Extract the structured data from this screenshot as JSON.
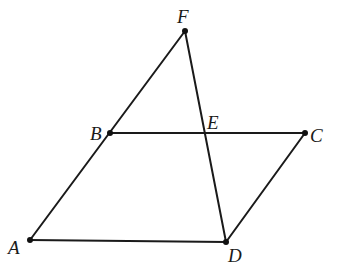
{
  "diagram": {
    "type": "geometry",
    "colors": {
      "line": "#1a1a1a",
      "point": "#111111",
      "background": "#ffffff"
    },
    "points": {
      "F": {
        "label": "F",
        "x": 185,
        "y": 31
      },
      "B": {
        "label": "B",
        "x": 110,
        "y": 133
      },
      "E": {
        "label": "E",
        "x": 205,
        "y": 133
      },
      "C": {
        "label": "C",
        "x": 305,
        "y": 133
      },
      "A": {
        "label": "A",
        "x": 30,
        "y": 240
      },
      "D": {
        "label": "D",
        "x": 226,
        "y": 242
      }
    },
    "segments": [
      "AF",
      "BC",
      "CD",
      "AD",
      "FD"
    ],
    "labels": {
      "F": "F",
      "B": "B",
      "E": "E",
      "C": "C",
      "A": "A",
      "D": "D"
    }
  }
}
